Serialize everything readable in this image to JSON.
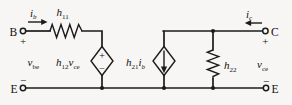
{
  "figure": {
    "kind": "circuit-schematic",
    "colors": {
      "ink": "#1b1b1b",
      "background": "#f7f6f4"
    }
  },
  "terminals": {
    "base": {
      "label": "B",
      "polarity": "+"
    },
    "collector": {
      "label": "C",
      "polarity": "+"
    },
    "emitter_left": {
      "label": "E",
      "polarity": "−"
    },
    "emitter_right": {
      "label": "E",
      "polarity": "−"
    }
  },
  "currents": {
    "base_current": {
      "sym": "i",
      "sub": "b",
      "direction": "right"
    },
    "collector_current": {
      "sym": "i",
      "sub": "c",
      "direction": "left"
    }
  },
  "voltages": {
    "input": {
      "sym": "v",
      "sub": "be"
    },
    "output": {
      "sym": "v",
      "sub": "ce"
    }
  },
  "components": {
    "input_resistance": {
      "sym": "h",
      "sub": "11",
      "type": "resistor"
    },
    "reverse_voltage_source": {
      "sym1": "h",
      "sub1": "12",
      "sym2": "v",
      "sub2": "ce",
      "type": "dependent-voltage-source",
      "plus": "+",
      "minus": "−"
    },
    "forward_current_source": {
      "sym1": "h",
      "sub1": "21",
      "sym2": "i",
      "sub2": "b",
      "type": "dependent-current-source",
      "arrow": "down"
    },
    "output_conductance": {
      "sym": "h",
      "sub": "22",
      "type": "resistor"
    }
  }
}
